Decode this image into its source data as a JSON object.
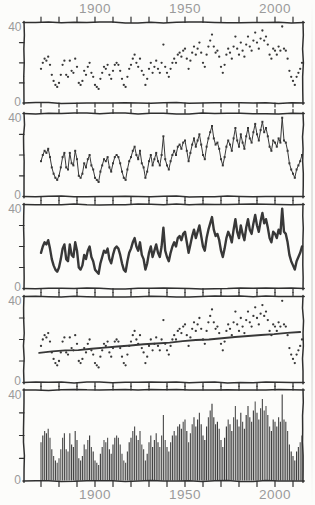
{
  "chart_data": {
    "type": [
      "scatter",
      "line",
      "line",
      "scatter",
      "bar"
    ],
    "title": "",
    "xlabel": "",
    "ylabel": "",
    "x_start_year": 1870,
    "x_step_years": 1,
    "values": [
      17,
      20,
      22,
      21,
      23,
      19,
      14,
      11,
      9,
      8,
      10,
      14,
      19,
      21,
      14,
      13,
      21,
      16,
      15,
      22,
      18,
      10,
      9,
      11,
      16,
      14,
      18,
      20,
      15,
      13,
      9,
      8,
      7,
      12,
      15,
      18,
      17,
      19,
      14,
      12,
      16,
      19,
      20,
      19,
      16,
      12,
      9,
      8,
      13,
      17,
      19,
      22,
      24,
      20,
      18,
      22,
      16,
      14,
      9,
      12,
      17,
      20,
      15,
      18,
      21,
      17,
      15,
      20,
      29,
      18,
      15,
      13,
      17,
      20,
      22,
      20,
      24,
      25,
      23,
      26,
      27,
      22,
      17,
      21,
      25,
      28,
      24,
      27,
      30,
      25,
      20,
      18,
      24,
      28,
      31,
      34,
      28,
      25,
      26,
      23,
      18,
      15,
      19,
      24,
      27,
      25,
      22,
      28,
      33,
      27,
      24,
      30,
      26,
      23,
      29,
      33,
      28,
      26,
      31,
      35,
      30,
      27,
      32,
      36,
      31,
      33,
      29,
      24,
      22,
      27,
      26,
      24,
      28,
      26,
      38,
      27,
      26,
      22,
      16,
      13,
      11,
      9,
      13,
      15,
      17,
      20
    ],
    "ylim": [
      0,
      40
    ],
    "y_axis_labels": {
      "top": "40",
      "bottom": "0"
    },
    "y_minor_ticks": [
      10,
      20,
      30
    ],
    "x_tick_start": 1870,
    "x_tick_end": 2010,
    "x_tick_step": 10,
    "x_axis_labels": [
      {
        "year": 1900,
        "label": "1900"
      },
      {
        "year": 1950,
        "label": "1950"
      },
      {
        "year": 2000,
        "label": "2000"
      }
    ],
    "grid": false,
    "legend": "none",
    "panels": [
      {
        "id": "scatter-panel",
        "type": "scatter"
      },
      {
        "id": "line-markers-panel",
        "type": "line-markers"
      },
      {
        "id": "thick-line-panel",
        "type": "line"
      },
      {
        "id": "scatter-trend-panel",
        "type": "scatter-trend",
        "trend": {
          "year0": 1869,
          "value0": 13.8,
          "year1": 2014,
          "value1": 23.5
        }
      },
      {
        "id": "bar-panel",
        "type": "bar"
      }
    ],
    "colors": {
      "ink": "#2f2f2f",
      "data": "#383838",
      "label": "#9a9a9a",
      "paper": "#fcfcfa"
    }
  }
}
